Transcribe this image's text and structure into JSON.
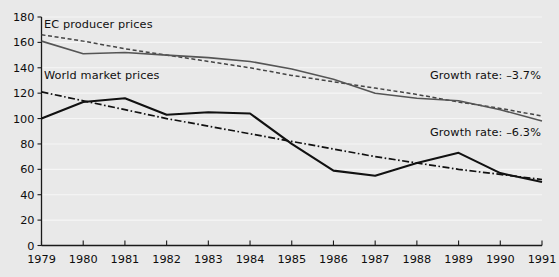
{
  "chart_data": {
    "type": "line",
    "title": "",
    "subtitle": "",
    "xlabel": "",
    "ylabel": "",
    "x": [
      1979,
      1980,
      1981,
      1982,
      1983,
      1984,
      1985,
      1986,
      1987,
      1988,
      1989,
      1990,
      1991
    ],
    "categories": [
      "1979",
      "1980",
      "1981",
      "1982",
      "1983",
      "1984",
      "1985",
      "1986",
      "1987",
      "1988",
      "1989",
      "1990",
      "1991"
    ],
    "xlim": [
      1979,
      1991
    ],
    "ylim": [
      0,
      180
    ],
    "ytick_values": [
      0,
      20,
      40,
      60,
      80,
      100,
      120,
      140,
      160,
      180
    ],
    "ytick_labels": [
      "0",
      "20",
      "40",
      "60",
      "80",
      "100",
      "120",
      "140",
      "160",
      "180"
    ],
    "grid": true,
    "grid_axis": "y",
    "grid_color": "#f6f6f6",
    "legend": "inline-annotations",
    "background_color": "#e9e9e9",
    "axis_color": "#1a1a1a",
    "series": [
      {
        "name": "EC producer prices",
        "style": "solid",
        "color": "#555555",
        "width": 1.6,
        "values": [
          161,
          151,
          152,
          150,
          148,
          145,
          139,
          131,
          120,
          116,
          114,
          107,
          98
        ]
      },
      {
        "name": "World market prices",
        "style": "solid",
        "color": "#111111",
        "width": 2.1,
        "values": [
          100,
          113,
          116,
          103,
          105,
          104,
          80,
          59,
          55,
          65,
          73,
          57,
          50
        ]
      },
      {
        "name": "EC producer prices trend",
        "style": "dashed",
        "color": "#444444",
        "width": 1.5,
        "values": [
          166,
          161,
          155,
          150,
          145,
          140,
          134,
          129,
          124,
          119,
          113,
          108,
          102
        ]
      },
      {
        "name": "World market prices trend",
        "style": "dash-dot",
        "color": "#111111",
        "width": 1.7,
        "values": [
          121,
          114,
          107,
          100,
          94,
          88,
          82,
          76,
          70,
          65,
          60,
          56,
          52
        ]
      }
    ],
    "annotations": [
      {
        "id": "label-ec",
        "text": "EC producer prices",
        "refers_to": "EC producer prices"
      },
      {
        "id": "label-world",
        "text": "World market prices",
        "refers_to": "World market prices"
      },
      {
        "id": "growth-ec",
        "text": "Growth rate: –3.7%",
        "refers_to": "EC producer prices trend",
        "value": -3.7
      },
      {
        "id": "growth-world",
        "text": "Growth rate: –6.3%",
        "refers_to": "World market prices trend",
        "value": -6.3
      }
    ]
  },
  "labels": {
    "ec_series": "EC producer prices",
    "world_series": "World market prices",
    "growth_ec": "Growth rate: –3.7%",
    "growth_world": "Growth rate: –6.3%"
  }
}
